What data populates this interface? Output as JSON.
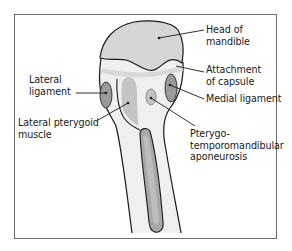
{
  "diagram": {
    "title": "",
    "colors": {
      "frame": "#6b6b6b",
      "outline": "#1a1a1a",
      "bone_fill": "#efefef",
      "head_fill": "#d6d6d6",
      "ligament_fill": "#9a9a9a",
      "muscle_fill": "#c4c4c4",
      "capsule_band": "#d9d9d9",
      "aponeurosis_fill": "#a8a8a8",
      "leader_line": "#1a1a1a"
    },
    "labels": {
      "head_of_mandible": {
        "line1": "Head of",
        "line2": "mandible"
      },
      "attachment_of_capsule": {
        "line1": "Attachment",
        "line2": "of capsule"
      },
      "medial_ligament": {
        "line1": "Medial ligament"
      },
      "lateral_ligament": {
        "line1": "Lateral",
        "line2": "ligament"
      },
      "lateral_pterygoid_muscle": {
        "line1": "Lateral pterygoid",
        "line2": "muscle"
      },
      "pterygotemporomandibular_aponeurosis": {
        "line1": "Pterygo-",
        "line2": "temporomandibular",
        "line3": "aponeurosis"
      }
    }
  }
}
